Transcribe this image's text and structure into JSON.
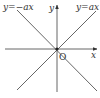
{
  "diagram": {
    "type": "coordinate-plane",
    "colors": {
      "line": "#555555",
      "text": "#333333",
      "background": "#ffffff"
    },
    "origin_label": "O",
    "x_axis_label": "x",
    "y_axis_label": "y",
    "lines": [
      {
        "name": "positive-slope",
        "equation": "y=ax"
      },
      {
        "name": "negative-slope",
        "equation": "y=−ax"
      }
    ]
  }
}
